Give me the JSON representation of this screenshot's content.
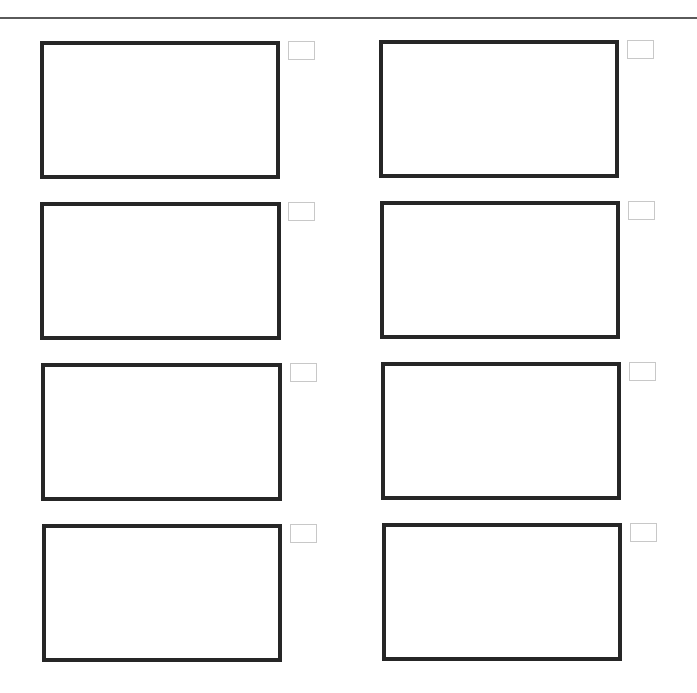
{
  "page": {
    "type": "storyboard-sheet",
    "columns": 2,
    "rows": 4,
    "colors": {
      "rule": "#5a5a5a",
      "frame_border": "#262626",
      "label_border": "#c8c8c8",
      "background": "#ffffff"
    }
  },
  "frames": [
    {
      "id": "frame-1",
      "row": 1,
      "col": 1,
      "x": 40,
      "y": 41,
      "w": 240,
      "h": 138,
      "label": {
        "x": 288,
        "y": 41,
        "text": ""
      }
    },
    {
      "id": "frame-2",
      "row": 1,
      "col": 2,
      "x": 379,
      "y": 40,
      "w": 240,
      "h": 138,
      "label": {
        "x": 627,
        "y": 40,
        "text": ""
      }
    },
    {
      "id": "frame-3",
      "row": 2,
      "col": 1,
      "x": 40,
      "y": 202,
      "w": 241,
      "h": 138,
      "label": {
        "x": 288,
        "y": 202,
        "text": ""
      }
    },
    {
      "id": "frame-4",
      "row": 2,
      "col": 2,
      "x": 380,
      "y": 201,
      "w": 240,
      "h": 138,
      "label": {
        "x": 628,
        "y": 201,
        "text": ""
      }
    },
    {
      "id": "frame-5",
      "row": 3,
      "col": 1,
      "x": 41,
      "y": 363,
      "w": 241,
      "h": 138,
      "label": {
        "x": 290,
        "y": 363,
        "text": ""
      }
    },
    {
      "id": "frame-6",
      "row": 3,
      "col": 2,
      "x": 381,
      "y": 362,
      "w": 240,
      "h": 138,
      "label": {
        "x": 629,
        "y": 362,
        "text": ""
      }
    },
    {
      "id": "frame-7",
      "row": 4,
      "col": 1,
      "x": 42,
      "y": 524,
      "w": 240,
      "h": 138,
      "label": {
        "x": 290,
        "y": 524,
        "text": ""
      }
    },
    {
      "id": "frame-8",
      "row": 4,
      "col": 2,
      "x": 382,
      "y": 523,
      "w": 240,
      "h": 138,
      "label": {
        "x": 630,
        "y": 523,
        "text": ""
      }
    }
  ]
}
